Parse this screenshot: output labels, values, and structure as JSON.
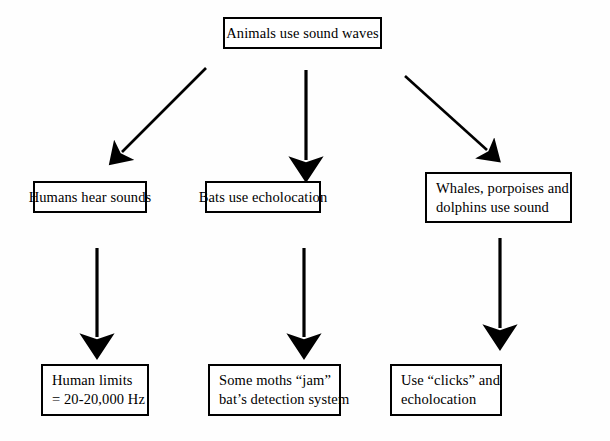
{
  "diagram": {
    "title_text": "Animals use sound waves",
    "nodes": {
      "root": {
        "line1": "Animals use sound waves"
      },
      "humans": {
        "line1": "Humans hear sounds"
      },
      "bats": {
        "line1": "Bats use echolocation"
      },
      "whales": {
        "line1": "Whales, porpoises and",
        "line2": "dolphins use sound"
      },
      "limits": {
        "line1": "Human limits",
        "line2": "= 20-20,000 Hz"
      },
      "moths": {
        "line1": "Some moths “jam”",
        "line2": "bat’s detection system"
      },
      "clicks": {
        "line1": "Use “clicks” and",
        "line2": "echolocation"
      }
    },
    "connectors": [
      {
        "name": "root-to-humans",
        "type": "diagonal-down-left"
      },
      {
        "name": "root-to-bats",
        "type": "vertical-down"
      },
      {
        "name": "root-to-whales",
        "type": "diagonal-down-right"
      },
      {
        "name": "humans-to-limits",
        "type": "vertical-down"
      },
      {
        "name": "bats-to-moths",
        "type": "vertical-down"
      },
      {
        "name": "whales-to-clicks",
        "type": "vertical-down"
      }
    ],
    "colors": {
      "stroke": "#000000",
      "box_fill": "#ffffff",
      "page_background": "#fefefe"
    }
  }
}
